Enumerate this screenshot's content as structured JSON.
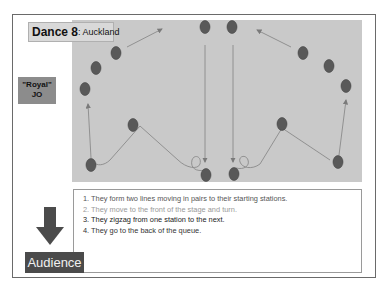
{
  "title": {
    "main": "Dance 8",
    "sub": ": Auckland"
  },
  "label_box": {
    "line1": "\"Royal\"",
    "line2": "JO"
  },
  "audience_label": "Audience",
  "steps": [
    "1. They form two lines moving in pairs to their starting stations.",
    "2. They move to the front of the stage and turn.",
    "3. They zigzag from one station to the next.",
    "4. They go to the back of the queue."
  ],
  "colors": {
    "stage": "#c9c9c9",
    "dancer": "#595959",
    "path": "#8a8a8a",
    "audience_bg": "#4b4b4b",
    "label_bg": "#8c8c8c"
  },
  "dancers": [
    {
      "x": 116,
      "y": 53
    },
    {
      "x": 96,
      "y": 68
    },
    {
      "x": 85,
      "y": 89
    },
    {
      "x": 133,
      "y": 125
    },
    {
      "x": 91,
      "y": 165
    },
    {
      "x": 206,
      "y": 175
    },
    {
      "x": 205,
      "y": 27
    },
    {
      "x": 232,
      "y": 27
    },
    {
      "x": 303,
      "y": 53
    },
    {
      "x": 329,
      "y": 66
    },
    {
      "x": 346,
      "y": 86
    },
    {
      "x": 282,
      "y": 124
    },
    {
      "x": 338,
      "y": 162
    },
    {
      "x": 234,
      "y": 174
    }
  ]
}
